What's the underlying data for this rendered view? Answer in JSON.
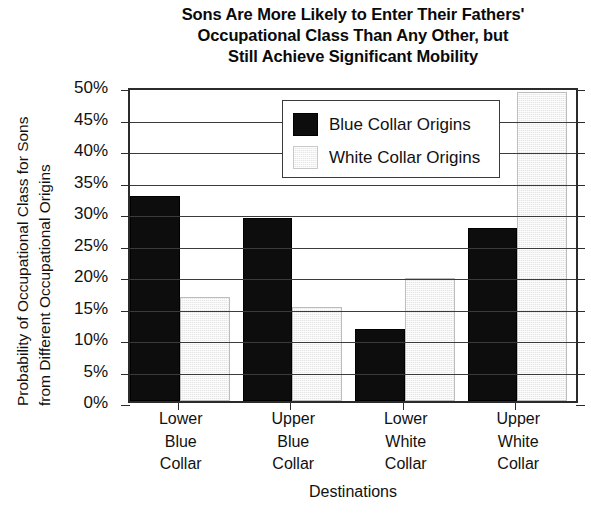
{
  "chart_data": {
    "type": "bar",
    "title": "Sons Are More Likely to Enter Their Fathers' Occupational Class Than Any Other, but Still Achieve Significant Mobility",
    "title_lines": [
      "Sons Are More Likely to Enter Their Fathers'",
      "Occupational Class Than Any Other, but",
      "Still Achieve Significant Mobility"
    ],
    "xlabel": "Destinations",
    "ylabel": "Probability of Occupational Class for Sons from Different Occupational Origins",
    "ylabel_lines": [
      "Probability of Occupational Class for Sons",
      "from Different Occupational Origins"
    ],
    "categories": [
      "Lower Blue Collar",
      "Upper Blue Collar",
      "Lower White Collar",
      "Upper White Collar"
    ],
    "category_lines": [
      [
        "Lower",
        "Blue",
        "Collar"
      ],
      [
        "Upper",
        "Blue",
        "Collar"
      ],
      [
        "Lower",
        "White",
        "Collar"
      ],
      [
        "Upper",
        "White",
        "Collar"
      ]
    ],
    "series": [
      {
        "name": "Blue Collar Origins",
        "color": "#0d0d0d",
        "values": [
          32.5,
          29.0,
          11.4,
          27.5
        ]
      },
      {
        "name": "White Collar Origins",
        "color": "#e6e6e6",
        "values": [
          16.5,
          15.0,
          19.5,
          49.0
        ]
      }
    ],
    "ylim": [
      0,
      50
    ],
    "ytick_step": 5,
    "ytick_labels": [
      "50%",
      "45%",
      "40%",
      "35%",
      "30%",
      "25%",
      "20%",
      "15%",
      "10%",
      "5%",
      "0%"
    ],
    "ytick_values": [
      50,
      45,
      40,
      35,
      30,
      25,
      20,
      15,
      10,
      5,
      0
    ],
    "grid": true,
    "legend_position": "upper center",
    "value_suffix": "%"
  },
  "legend": {
    "entries": [
      {
        "label": "Blue Collar Origins",
        "swatch": "blue"
      },
      {
        "label": "White Collar Origins",
        "swatch": "white"
      }
    ]
  }
}
